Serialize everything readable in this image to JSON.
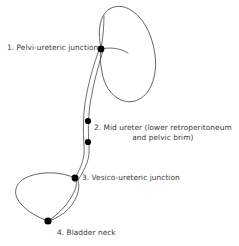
{
  "figure": {
    "background_color": "#ffffff",
    "stroke_color": "#4a4a4a",
    "marker_color": "#000000",
    "text_color": "#3a3a3a"
  },
  "labels": {
    "pelvi_ureteric_junction": "1. Pelvi-ureteric junction",
    "mid_ureter_line1": "2. Mid ureter (lower retroperitoneum",
    "mid_ureter_line2": "and pelvic brim)",
    "vesico_ureteric_junction": "3. Vesico-ureteric junction",
    "bladder_neck": "4. Bladder neck"
  },
  "caption": {
    "clipped_text": ""
  },
  "structures": {
    "kidney": "kidney-outline",
    "ureter": "ureter-tube",
    "bladder": "bladder-outline",
    "renal_pelvis": "renal-pelvis-leader"
  },
  "markers": [
    {
      "id": "marker-1",
      "name": "pelvi-ureteric-junction-marker",
      "x": 101,
      "y": 49,
      "r": 3.4
    },
    {
      "id": "marker-2a",
      "name": "mid-ureter-upper-marker",
      "x": 88,
      "y": 121,
      "r": 3.1
    },
    {
      "id": "marker-2b",
      "name": "mid-ureter-lower-marker",
      "x": 88,
      "y": 142,
      "r": 3.1
    },
    {
      "id": "marker-3",
      "name": "vesico-ureteric-junction-marker",
      "x": 75,
      "y": 178,
      "r": 3.4
    },
    {
      "id": "marker-4",
      "name": "bladder-neck-marker",
      "x": 48,
      "y": 221,
      "r": 3.6
    }
  ]
}
